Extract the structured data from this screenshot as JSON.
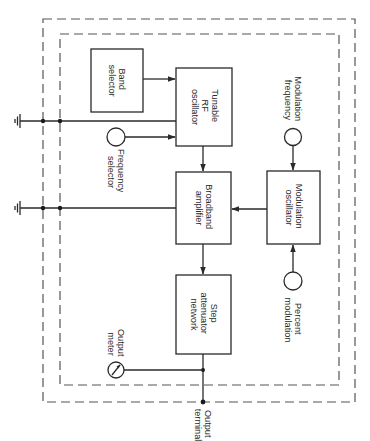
{
  "diagram": {
    "type": "block-diagram",
    "orientation": "rotated-90-clockwise",
    "blocks": {
      "band_selector": {
        "line1": "Band",
        "line2": "selector"
      },
      "tunable_rf_oscillator": {
        "line1": "Tunable",
        "line2": "RF",
        "line3": "oscillator"
      },
      "broadband_amplifier": {
        "line1": "Broadband",
        "line2": "amplifier"
      },
      "modulation_oscillator": {
        "line1": "Modulation",
        "line2": "oscillator"
      },
      "step_attenuator_network": {
        "line1": "Step",
        "line2": "attenuator",
        "line3": "network"
      }
    },
    "controls": {
      "frequency_selector": {
        "line1": "Frequency",
        "line2": "selector"
      },
      "modulation_frequency": {
        "line1": "Modulation",
        "line2": "frequency"
      },
      "percent_modulation": {
        "line1": "Percent",
        "line2": "modulation"
      },
      "output_meter": {
        "line1": "Output",
        "line2": "meter"
      }
    },
    "terminals": {
      "output_terminal": {
        "line1": "Output",
        "line2": "terminal"
      }
    },
    "connections": [
      {
        "from": "Band selector",
        "to": "Tunable RF oscillator"
      },
      {
        "from": "Frequency selector",
        "to": "Tunable RF oscillator"
      },
      {
        "from": "Tunable RF oscillator",
        "to": "Broadband amplifier"
      },
      {
        "from": "Modulation frequency",
        "to": "Modulation oscillator"
      },
      {
        "from": "Percent modulation",
        "to": "Modulation oscillator"
      },
      {
        "from": "Modulation oscillator",
        "to": "Broadband amplifier"
      },
      {
        "from": "Broadband amplifier",
        "to": "Step attenuator network"
      },
      {
        "from": "Step attenuator network",
        "to": "Output terminal"
      },
      {
        "from": "Step attenuator network",
        "to": "Output meter"
      }
    ],
    "grounds": 2,
    "shields": [
      "outer",
      "inner"
    ],
    "colors": {
      "line": "#2a2a2a",
      "shield": "#555555",
      "background": "#ffffff"
    }
  }
}
